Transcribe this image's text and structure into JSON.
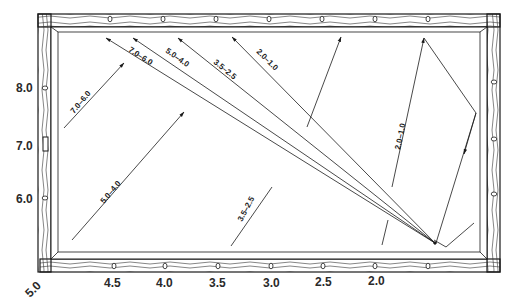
{
  "diagram": {
    "type": "billiards-diamond-system",
    "colors": {
      "ink": "#1a1a1a",
      "rail_wood": "#ffffff",
      "background": "#ffffff"
    },
    "left_rail_labels": [
      "8.0",
      "7.0",
      "6.0"
    ],
    "corner_label": "5.0",
    "bottom_rail_labels": [
      "4.5",
      "4.0",
      "3.5",
      "3.0",
      "2.5",
      "2.0"
    ],
    "fan_lines": [
      {
        "label": "7.0–6.0"
      },
      {
        "label": "5.0–4.0"
      },
      {
        "label": "3.5–2.5"
      },
      {
        "label": "2.0–1.0"
      }
    ],
    "cue_lines": [
      {
        "label": "7.0–6.0"
      },
      {
        "label": "5.0–4.0"
      },
      {
        "label": "3.5–2.5"
      },
      {
        "label": "2.0–1.0"
      }
    ]
  }
}
